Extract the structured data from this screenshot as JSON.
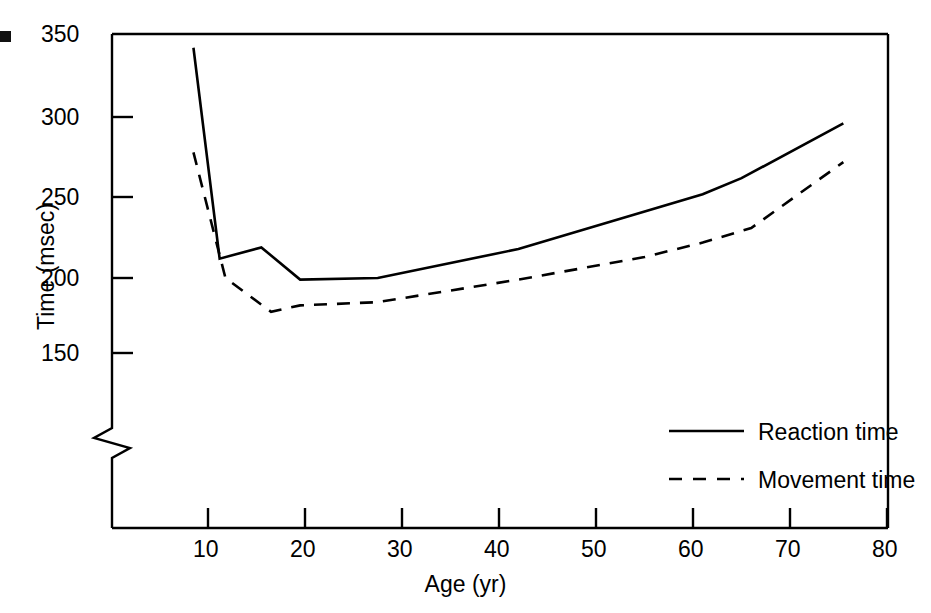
{
  "chart_data": {
    "type": "line",
    "title": "",
    "xlabel": "Age (yr)",
    "ylabel": "Time (msec)",
    "xlim": [
      0,
      80
    ],
    "ylim": [
      150,
      350
    ],
    "xticks": [
      10,
      20,
      30,
      40,
      50,
      60,
      70,
      80
    ],
    "xtick_labels": [
      "10",
      "20",
      "30",
      "40",
      "50",
      "60",
      "70",
      "80"
    ],
    "yticks": [
      150,
      200,
      250,
      300,
      350
    ],
    "ytick_labels": [
      "150",
      "200",
      "250",
      "300",
      "350"
    ],
    "grid": false,
    "y_axis_break": true,
    "legend_position": "lower right",
    "series": [
      {
        "name": "Reaction time",
        "style": "solid",
        "x": [
          8.5,
          11.2,
          15.5,
          19.5,
          27.5,
          42.0,
          61.0,
          65.0,
          75.5
        ],
        "y": [
          343,
          212,
          219,
          199,
          200,
          218,
          252,
          262,
          296
        ]
      },
      {
        "name": "Movement time",
        "style": "dashed",
        "x": [
          8.5,
          11.8,
          16.5,
          19.5,
          27.5,
          42.0,
          55.0,
          61.0,
          66.0,
          75.5
        ],
        "y": [
          278,
          200,
          179,
          183,
          185,
          199,
          213,
          222,
          231,
          272
        ]
      }
    ]
  },
  "axis": {
    "y_title": "Time (msec)",
    "x_title": "Age (yr)",
    "y_tick_labels": [
      "350",
      "300",
      "250",
      "200",
      "150"
    ],
    "x_tick_labels": [
      "10",
      "20",
      "30",
      "40",
      "50",
      "60",
      "70",
      "80"
    ]
  },
  "legend": {
    "entries": [
      {
        "label": "Reaction time",
        "style": "solid"
      },
      {
        "label": "Movement time",
        "style": "dashed"
      }
    ]
  },
  "marks": {
    "edge_marker": "black-square-marker"
  },
  "colors": {
    "ink": "#000000",
    "background": "#ffffff"
  }
}
